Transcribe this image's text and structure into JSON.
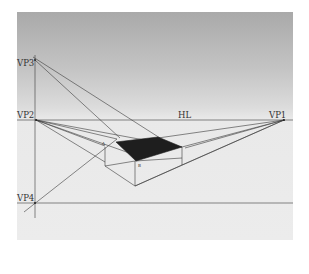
{
  "diagram": {
    "labels": {
      "vp1": "VP1",
      "vp2": "VP2",
      "vp3": "VP3",
      "vp4": "VP4",
      "horizon": "HL",
      "point_a": "A",
      "point_b": "B"
    },
    "colors": {
      "line": "#3a3a3a",
      "fill": "#1e1e1e",
      "sky_top": "#a9a9a9",
      "ground": "#ececec"
    }
  }
}
